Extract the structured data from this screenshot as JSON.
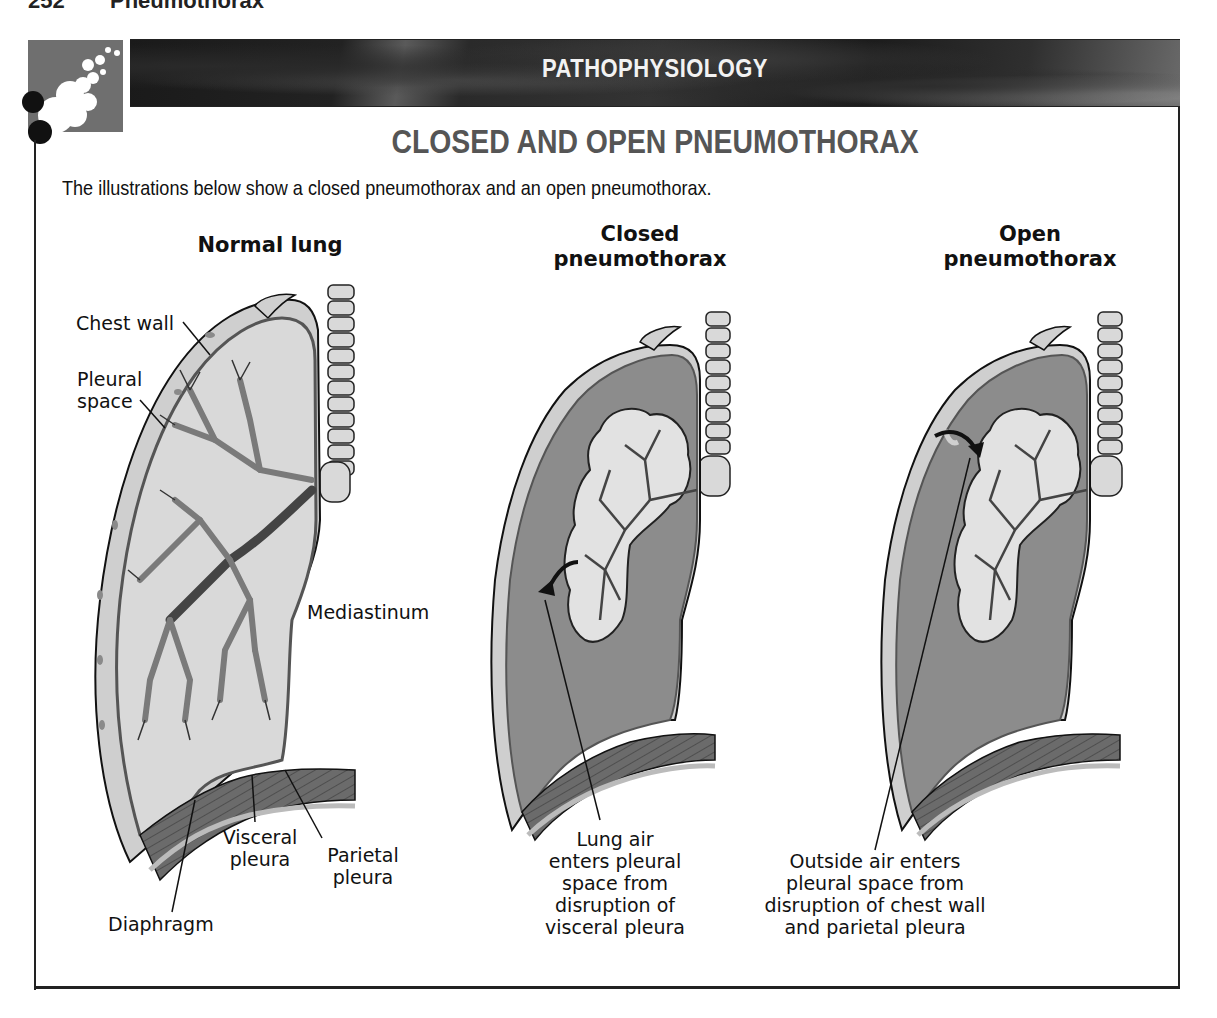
{
  "running_head": {
    "page_number": "252",
    "section": "Pneumothorax"
  },
  "banner": {
    "label": "PATHOPHYSIOLOGY"
  },
  "title": "CLOSED AND OPEN PNEUMOTHORAX",
  "intro": "The illustrations below show a closed pneumothorax and an open pneumothorax.",
  "colors": {
    "banner_bg": "#222222",
    "logo_bg": "#6f6f6f",
    "title_gray": "#555555",
    "lung_light": "#d6d6d6",
    "pleural_dark": "#8a8a8a",
    "airway": "#7f7f7f",
    "diaphragm": "#6b6b6b"
  },
  "panels": [
    {
      "id": "normal",
      "title_lines": [
        "Normal lung"
      ],
      "labels": [
        {
          "key": "chest_wall",
          "text": "Chest wall"
        },
        {
          "key": "pleural_space",
          "lines": [
            "Pleural",
            "space"
          ]
        },
        {
          "key": "mediastinum",
          "text": "Mediastinum"
        },
        {
          "key": "visceral_pleura",
          "lines": [
            "Visceral",
            "pleura"
          ]
        },
        {
          "key": "parietal_pleura",
          "lines": [
            "Parietal",
            "pleura"
          ]
        },
        {
          "key": "diaphragm",
          "text": "Diaphragm"
        }
      ]
    },
    {
      "id": "closed",
      "title_lines": [
        "Closed",
        "pneumothorax"
      ],
      "caption_lines": [
        "Lung air",
        "enters pleural",
        "space from",
        "disruption of",
        "visceral pleura"
      ]
    },
    {
      "id": "open",
      "title_lines": [
        "Open",
        "pneumothorax"
      ],
      "caption_lines": [
        "Outside air enters",
        "pleural space from",
        "disruption of chest wall",
        "and parietal pleura"
      ]
    }
  ]
}
